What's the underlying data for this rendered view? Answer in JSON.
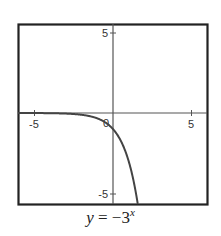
{
  "chart_data": {
    "type": "line",
    "caption": {
      "lhs": "y",
      "equals": "=",
      "rhs_prefix": "−3",
      "exponent": "x"
    },
    "xlabel": "",
    "ylabel": "",
    "xlim": [
      -6,
      6
    ],
    "ylim": [
      -5.6,
      5.6
    ],
    "grid": false,
    "x_ticks": [
      -5,
      0,
      5
    ],
    "y_ticks": [
      -5,
      5
    ],
    "tick_labels": {
      "x_neg": "-5",
      "x_pos": "5",
      "origin": "0",
      "y_pos": "5",
      "y_neg": "-5"
    },
    "series": [
      {
        "name": "y = -3^x",
        "function": "-3^x",
        "x": [
          -6,
          -5,
          -4,
          -3,
          -2,
          -1,
          0,
          0.5,
          1,
          1.25,
          1.5,
          1.57
        ],
        "y": [
          -0.0014,
          -0.0041,
          -0.0123,
          -0.037,
          -0.111,
          -0.333,
          -1,
          -1.732,
          -3,
          -3.948,
          -5.196,
          -5.6
        ]
      }
    ],
    "colors": {
      "curve": "#444444",
      "axes": "#555555",
      "frame": "#222222",
      "text": "#333333"
    }
  }
}
